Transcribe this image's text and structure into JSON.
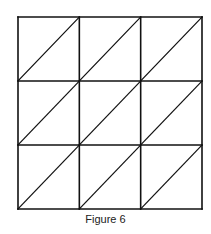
{
  "figure": {
    "caption": "Figure 6",
    "grid": {
      "rows": 3,
      "cols": 3,
      "left": 18,
      "top": 17,
      "right": 202,
      "bottom": 209,
      "stroke_color": "#111111",
      "diagonal": "bottom-left to top-right in each cell"
    }
  }
}
